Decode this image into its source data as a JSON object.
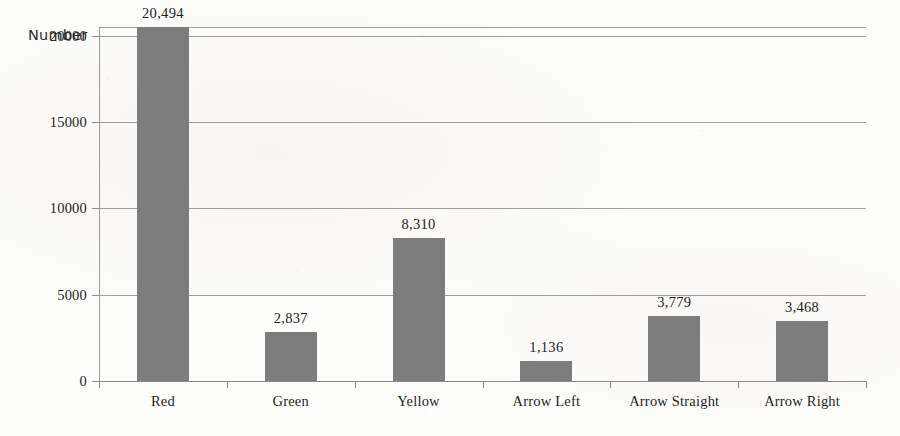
{
  "chart_data": {
    "type": "bar",
    "title": "",
    "subtitle": "",
    "xlabel": "",
    "ylabel": "Number",
    "categories": [
      "Red",
      "Green",
      "Yellow",
      "Arrow Left",
      "Arrow Straight",
      "Arrow Right"
    ],
    "values": [
      20494,
      2837,
      8310,
      1136,
      3779,
      3468
    ],
    "value_labels": [
      "20,494",
      "2,837",
      "8,310",
      "1,136",
      "3,779",
      "3,468"
    ],
    "ylim": [
      0,
      20500
    ],
    "yticks": [
      0,
      5000,
      10000,
      15000,
      20000
    ],
    "ytick_labels": [
      "0",
      "5000",
      "10000",
      "15000",
      "20000"
    ],
    "grid": true,
    "legend": false,
    "legend_position": "none",
    "series": [
      {
        "name": "Number",
        "values": [
          20494,
          2837,
          8310,
          1136,
          3779,
          3468
        ]
      }
    ],
    "colors": {
      "bar_fill": "#7d7d7d",
      "gridline": "#8e8e8e",
      "axis": "#8a8a8a",
      "text": "#1e1e1e",
      "background": "#fdfdfc"
    }
  }
}
